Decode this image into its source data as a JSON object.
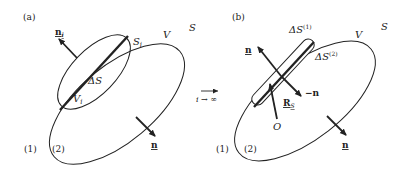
{
  "figure": {
    "colors": {
      "stroke": "#222222",
      "background": "#ffffff"
    },
    "panel_a": {
      "tag": "(a)",
      "surface_label": "S",
      "volume_label": "V",
      "sub_surface_label": "S",
      "sub_surface_index": "i",
      "sub_volume_label": "V",
      "sub_volume_index": "i",
      "delta_label": "ΔS",
      "normal_i_label": "n",
      "normal_i_index": "i",
      "normal_label": "n",
      "region_1": "(1)",
      "region_2": "(2)"
    },
    "transition": {
      "arrow": "⟶",
      "limit": "i → ∞"
    },
    "panel_b": {
      "tag": "(b)",
      "surface_label": "S",
      "volume_label": "V",
      "delta1_label": "ΔS",
      "delta1_sup": "(1)",
      "delta2_label": "ΔS",
      "delta2_sup": "(2)",
      "normal_label": "n",
      "neg_normal_label": "−n",
      "position_label": "R",
      "position_sub": "S",
      "origin_label": "O",
      "outer_normal_label": "n",
      "region_1": "(1)",
      "region_2": "(2)"
    }
  }
}
